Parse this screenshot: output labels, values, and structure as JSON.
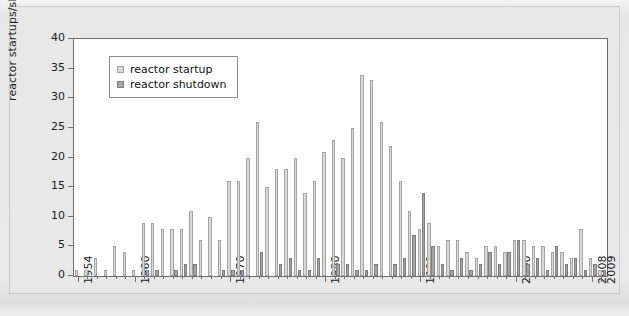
{
  "chart_data": {
    "type": "bar",
    "title": "",
    "subtitle": "",
    "xlabel": "",
    "ylabel": "reactor startups/shutdowns",
    "ylim": [
      0,
      40
    ],
    "ytick_step": 5,
    "yticks": [
      0,
      5,
      10,
      15,
      20,
      25,
      30,
      35,
      40
    ],
    "grid": false,
    "legend_position": "top-left",
    "xtick_labels": [
      "1954",
      "1960",
      "1970",
      "1980",
      "1990",
      "2000",
      "2008",
      "2009"
    ],
    "categories": [
      "1954",
      "1955",
      "1956",
      "1957",
      "1958",
      "1959",
      "1960",
      "1961",
      "1962",
      "1963",
      "1964",
      "1965",
      "1966",
      "1967",
      "1968",
      "1969",
      "1970",
      "1971",
      "1972",
      "1973",
      "1974",
      "1975",
      "1976",
      "1977",
      "1978",
      "1979",
      "1980",
      "1981",
      "1982",
      "1983",
      "1984",
      "1985",
      "1986",
      "1987",
      "1988",
      "1989",
      "1990",
      "1991",
      "1992",
      "1993",
      "1994",
      "1995",
      "1996",
      "1997",
      "1998",
      "1999",
      "2000",
      "2001",
      "2002",
      "2003",
      "2004",
      "2005",
      "2006",
      "2007",
      "2008",
      "2009"
    ],
    "series": [
      {
        "name": "reactor startup",
        "color": "#d9d9d9",
        "values": [
          1,
          1,
          3,
          1,
          5,
          4,
          1,
          9,
          9,
          8,
          8,
          8,
          11,
          6,
          10,
          6,
          16,
          16,
          20,
          26,
          15,
          18,
          18,
          20,
          14,
          16,
          21,
          23,
          20,
          25,
          34,
          33,
          26,
          22,
          16,
          11,
          8,
          9,
          5,
          6,
          6,
          4,
          3,
          5,
          5,
          4,
          6,
          6,
          5,
          5,
          4,
          4,
          3,
          8,
          3,
          1
        ]
      },
      {
        "name": "reactor shutdown",
        "color": "#a6a6a6",
        "values": [
          0,
          0,
          0,
          0,
          0,
          0,
          0,
          1,
          1,
          0,
          1,
          2,
          2,
          0,
          0,
          1,
          1,
          1,
          0,
          4,
          0,
          2,
          3,
          1,
          1,
          3,
          0,
          2,
          2,
          1,
          1,
          2,
          0,
          2,
          3,
          7,
          14,
          5,
          2,
          1,
          3,
          1,
          2,
          4,
          2,
          4,
          6,
          2,
          3,
          1,
          5,
          2,
          3,
          1,
          2,
          1
        ]
      }
    ]
  },
  "legend": {
    "entries": [
      {
        "label": "reactor startup",
        "swatch": "start"
      },
      {
        "label": "reactor shutdown",
        "swatch": "stop"
      }
    ]
  },
  "axis": {
    "y_title": "reactor startups/shutdowns"
  }
}
